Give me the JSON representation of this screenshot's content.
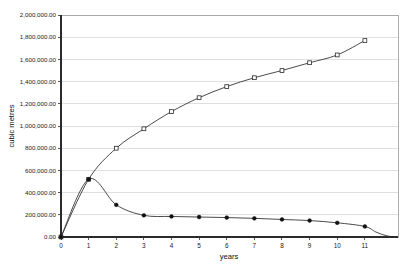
{
  "chart_data": {
    "type": "line",
    "title": "",
    "xlabel": "years",
    "ylabel": "cubic metres",
    "xlim": [
      0,
      12.2
    ],
    "ylim": [
      0,
      2000000
    ],
    "grid": true,
    "legend": "none",
    "x": [
      0,
      1,
      2,
      3,
      4,
      5,
      6,
      7,
      8,
      9,
      10,
      11
    ],
    "x_tick_labels": [
      "0",
      "1",
      "2",
      "3",
      "4",
      "5",
      "6",
      "7",
      "8",
      "9",
      "10",
      "11"
    ],
    "y_tick_values": [
      0,
      200000,
      400000,
      600000,
      800000,
      1000000,
      1200000,
      1400000,
      1600000,
      1800000,
      2000000
    ],
    "y_tick_labels": [
      "0.00",
      "200,000.00",
      "400,000.00",
      "600,000.00",
      "800,000.00",
      "1,000,000.00",
      "1,200,000.00",
      "1,400,000.00",
      "1,600,000.00",
      "1,800,000.00",
      "2,000,000.00"
    ],
    "series": [
      {
        "name": "cumulative-volume",
        "marker": "open-square",
        "color": "#2a2a2a",
        "values": [
          0,
          520000,
          800000,
          975000,
          1130000,
          1255000,
          1355000,
          1435000,
          1500000,
          1570000,
          1640000,
          1770000
        ]
      },
      {
        "name": "annual-volume",
        "marker": "filled-circle",
        "color": "#111111",
        "values": [
          0,
          520000,
          290000,
          195000,
          185000,
          180000,
          175000,
          168000,
          158000,
          148000,
          128000,
          95000
        ],
        "tail": {
          "x": [
            11,
            11.4,
            11.8,
            12.2
          ],
          "values": [
            95000,
            45000,
            10000,
            0
          ]
        }
      }
    ]
  }
}
